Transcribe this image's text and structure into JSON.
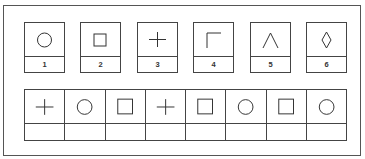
{
  "key": {
    "items": [
      {
        "number": "1",
        "symbol": "circle"
      },
      {
        "number": "2",
        "symbol": "square"
      },
      {
        "number": "3",
        "symbol": "plus"
      },
      {
        "number": "4",
        "symbol": "corner"
      },
      {
        "number": "5",
        "symbol": "caret"
      },
      {
        "number": "6",
        "symbol": "diamond"
      }
    ]
  },
  "test": {
    "cells": [
      {
        "symbol": "plus",
        "answer": ""
      },
      {
        "symbol": "circle",
        "answer": ""
      },
      {
        "symbol": "square",
        "answer": ""
      },
      {
        "symbol": "plus",
        "answer": ""
      },
      {
        "symbol": "square",
        "answer": ""
      },
      {
        "symbol": "circle",
        "answer": ""
      },
      {
        "symbol": "square",
        "answer": ""
      },
      {
        "symbol": "circle",
        "answer": ""
      }
    ]
  }
}
